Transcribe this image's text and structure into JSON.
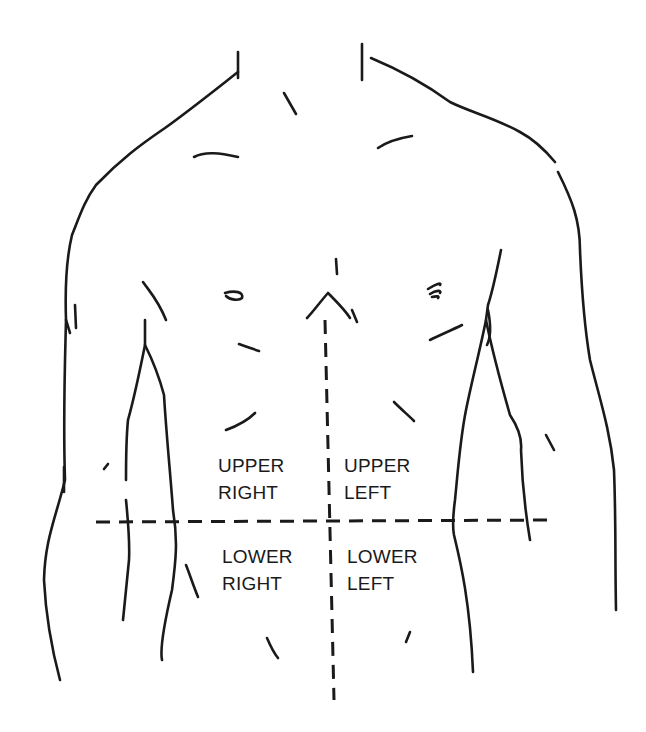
{
  "diagram": {
    "type": "torso-quadrant-diagram",
    "line_color": "#1a1a1a",
    "background": "#ffffff",
    "quadrants": [
      {
        "id": "upper-right",
        "line1": "UPPER",
        "line2": "RIGHT"
      },
      {
        "id": "upper-left",
        "line1": "UPPER",
        "line2": "LEFT"
      },
      {
        "id": "lower-right",
        "line1": "LOWER",
        "line2": "RIGHT"
      },
      {
        "id": "lower-left",
        "line1": "LOWER",
        "line2": "LEFT"
      }
    ],
    "dividers": [
      "vertical-midline-dashed",
      "horizontal-umbilical-line-dashed"
    ]
  }
}
